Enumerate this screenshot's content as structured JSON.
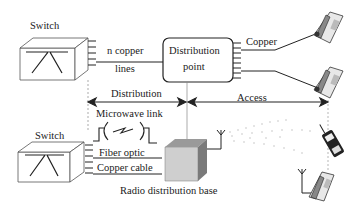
{
  "diagram": {
    "top": {
      "switch_label": "Switch",
      "link_label_line1": "n copper",
      "link_label_line2": "lines",
      "dp_label_line1": "Distribution",
      "dp_label_line2": "point",
      "copper_label": "Copper"
    },
    "segments": {
      "distribution": "Distribution",
      "access": "Access"
    },
    "bottom": {
      "switch_label": "Switch",
      "microwave_label": "Microwave link",
      "fiber_label": "Fiber optic",
      "copper_cable_label": "Copper cable",
      "base_label": "Radio distribution base"
    },
    "colors": {
      "line": "#1a1a1a",
      "box_front": "#cfcfcf",
      "box_top": "#9a9a9a",
      "box_side": "#7a7a7a",
      "signal_dots": "#b8b8b8"
    }
  }
}
